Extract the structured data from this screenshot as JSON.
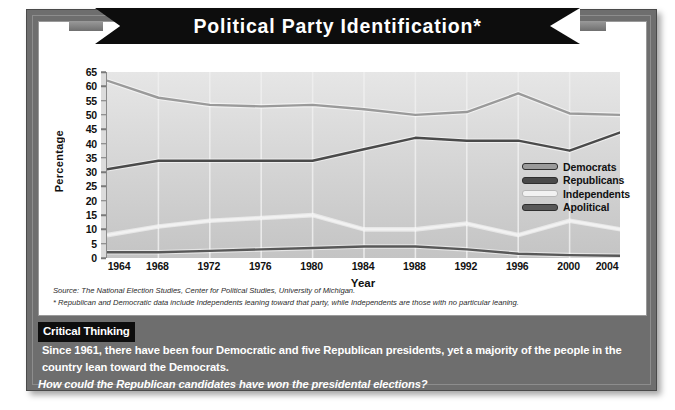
{
  "title": "Political Party Identification*",
  "axes": {
    "y_label": "Percentage",
    "x_label": "Year",
    "y_ticks": [
      0,
      5,
      10,
      15,
      20,
      25,
      30,
      35,
      40,
      45,
      50,
      55,
      60,
      65
    ],
    "x_ticks": [
      1964,
      1968,
      1972,
      1976,
      1980,
      1984,
      1988,
      1992,
      1996,
      2000,
      2004
    ]
  },
  "legend": [
    {
      "label": "Democrats",
      "color": "#9a9a9a"
    },
    {
      "label": "Republicans",
      "color": "#4a4a4a"
    },
    {
      "label": "Independents",
      "color": "#f2f2f2"
    },
    {
      "label": "Apolitical",
      "color": "#585858"
    }
  ],
  "source": {
    "line1": "Source: The National Election Studies, Center for Political Studies, University of Michigan.",
    "line2": "* Republican and Democratic data include Independents leaning toward that party, while Independents are those with no particular leaning."
  },
  "critical_thinking": {
    "badge": "Critical Thinking",
    "statement": "Since 1961, there have been four Democratic and five Republican presidents, yet a majority of the people in the country lean toward the Democrats.",
    "question": "How could the Republican candidates have won the presidental elections?"
  },
  "chart_data": {
    "type": "line",
    "title": "Political Party Identification*",
    "xlabel": "Year",
    "ylabel": "Percentage",
    "xlim": [
      1964,
      2004
    ],
    "ylim": [
      0,
      65
    ],
    "grid": true,
    "legend_position": "center-right",
    "x": [
      1964,
      1968,
      1972,
      1976,
      1980,
      1984,
      1988,
      1992,
      1996,
      2000,
      2004
    ],
    "series": [
      {
        "name": "Democrats",
        "color": "#9a9a9a",
        "values": [
          62,
          56,
          53.5,
          53,
          53.5,
          52,
          50,
          51,
          57.5,
          50.5,
          50
        ]
      },
      {
        "name": "Republicans",
        "color": "#4a4a4a",
        "values": [
          31,
          34,
          34,
          34,
          34,
          38,
          42,
          41,
          41,
          37.5,
          44
        ]
      },
      {
        "name": "Independents",
        "color": "#f2f2f2",
        "values": [
          8,
          11,
          13,
          14,
          15,
          10,
          10,
          12,
          8,
          13,
          10
        ]
      },
      {
        "name": "Apolitical",
        "color": "#585858",
        "values": [
          2,
          2,
          2.5,
          3,
          3.5,
          4,
          4,
          3,
          1.5,
          1,
          0.8
        ]
      }
    ]
  }
}
